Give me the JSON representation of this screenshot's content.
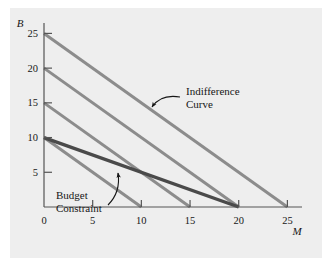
{
  "figure": {
    "panel_color": "#eeeeee",
    "page_color": "#ffffff",
    "axis_color": "#555555",
    "indifference_color": "#8c8c8c",
    "budget_color": "#4a4a4a",
    "text_color": "#161616"
  },
  "chart_data": {
    "type": "line",
    "title": "",
    "xlabel": "M",
    "ylabel": "B",
    "xlim": [
      0,
      26.5
    ],
    "ylim": [
      0,
      26.5
    ],
    "xticks": [
      0,
      5,
      10,
      15,
      20,
      25
    ],
    "xticklabels": [
      "0",
      "5",
      "10",
      "15",
      "20",
      "25"
    ],
    "yticks": [
      5,
      10,
      15,
      20,
      25
    ],
    "yticklabels": [
      "5",
      "10",
      "15",
      "20",
      "25"
    ],
    "grid": false,
    "legend": "none",
    "series": [
      {
        "name": "Indifference Curve 1",
        "kind": "indifference",
        "color": "#8c8c8c",
        "linewidth": 3,
        "slope": -1,
        "intercept": 10,
        "x": [
          0,
          10
        ],
        "y": [
          10,
          0
        ]
      },
      {
        "name": "Indifference Curve 2",
        "kind": "indifference",
        "color": "#8c8c8c",
        "linewidth": 3,
        "slope": -1,
        "intercept": 15,
        "x": [
          0,
          15
        ],
        "y": [
          15,
          0
        ]
      },
      {
        "name": "Indifference Curve 3",
        "kind": "indifference",
        "color": "#8c8c8c",
        "linewidth": 3,
        "slope": -1,
        "intercept": 20,
        "x": [
          0,
          20
        ],
        "y": [
          20,
          0
        ]
      },
      {
        "name": "Indifference Curve 4",
        "kind": "indifference",
        "color": "#8c8c8c",
        "linewidth": 3,
        "slope": -1,
        "intercept": 25,
        "x": [
          0,
          25
        ],
        "y": [
          25,
          0
        ]
      },
      {
        "name": "Budget Constraint",
        "kind": "budget",
        "color": "#4a4a4a",
        "linewidth": 3.4,
        "slope": -0.5,
        "intercept": 10,
        "x": [
          0,
          20
        ],
        "y": [
          10,
          0
        ]
      }
    ],
    "annotations": [
      {
        "id": "indifference-curve",
        "lines": [
          "Indifference",
          "Curve"
        ],
        "text_x": 14.6,
        "text_y": 17.4,
        "arrow_tip_x": 11.5,
        "arrow_tip_y": 14.6
      },
      {
        "id": "budget-constraint",
        "lines": [
          "Budget",
          "Constraint"
        ],
        "text_x": 3.0,
        "text_y": 3.3,
        "arrow_tip_x": 7.0,
        "arrow_tip_y": 6.6
      }
    ]
  },
  "axis": {
    "y_name": "B",
    "x_name": "M"
  },
  "annotations": {
    "indifference": {
      "line1": "Indifference",
      "line2": "Curve"
    },
    "budget": {
      "line1": "Budget",
      "line2": "Constraint"
    }
  }
}
